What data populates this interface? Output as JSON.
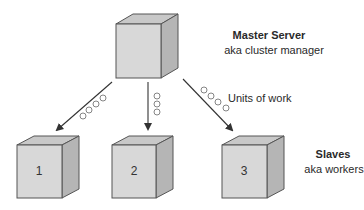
{
  "master": {
    "title": "Master Server",
    "subtitle": "aka cluster manager"
  },
  "slaves": {
    "title": "Slaves",
    "subtitle": "aka workers",
    "nodes": [
      {
        "label": "1"
      },
      {
        "label": "2"
      },
      {
        "label": "3"
      }
    ]
  },
  "work_label": "Units of work",
  "colors": {
    "cube_front": "#d6d6d6",
    "cube_top": "#c4c4c4",
    "cube_side": "#b3b3b3",
    "edge": "#555555",
    "arrow": "#333333"
  }
}
